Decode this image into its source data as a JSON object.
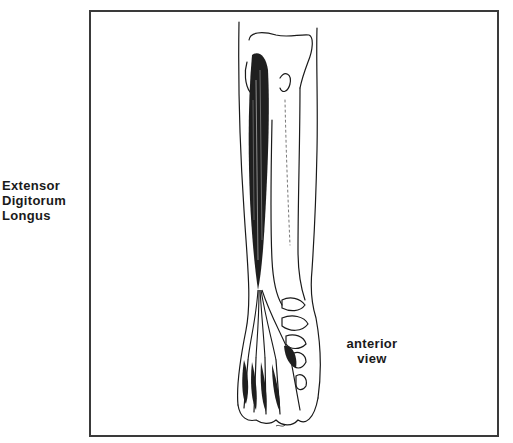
{
  "muscle_label": {
    "lines": [
      "Extensor",
      "Digitorum",
      "Longus"
    ]
  },
  "view_label": {
    "lines": [
      "anterior",
      "view"
    ]
  },
  "illustration": {
    "subject": "lower leg and foot, anterior view, showing extensor digitorum longus muscle and tendons",
    "line_color": "#1a1a1a",
    "frame_color": "#3a3a3a"
  }
}
